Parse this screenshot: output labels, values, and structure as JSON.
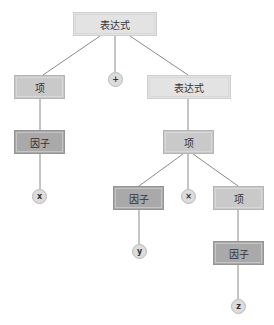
{
  "tree": {
    "root": {
      "label": "表达式"
    },
    "left_term": {
      "label": "项"
    },
    "plus_op": {
      "label": "+"
    },
    "right_expr": {
      "label": "表达式"
    },
    "left_factor": {
      "label": "因子"
    },
    "x_leaf": {
      "label": "x"
    },
    "mid_term": {
      "label": "项"
    },
    "mid_factor": {
      "label": "因子"
    },
    "times_op": {
      "label": "×"
    },
    "right_term": {
      "label": "项"
    },
    "y_leaf": {
      "label": "y"
    },
    "bottom_factor": {
      "label": "因子"
    },
    "z_leaf": {
      "label": "z"
    }
  },
  "colors": {
    "edge": "#8a8a8a",
    "expr_fill": "#e3e3e3",
    "term_fill": "#c9c9c9",
    "factor_fill": "#a9a9a9",
    "leaf_fill": "#dcdcdc"
  }
}
